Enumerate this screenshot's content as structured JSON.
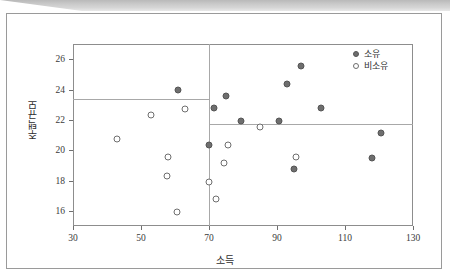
{
  "figure": {
    "background_color": "#ffffff",
    "frame_color": "#9a9a9a",
    "scan_strip_color": "#c9c9c9"
  },
  "chart_data": {
    "type": "scatter",
    "title": "",
    "xlabel": "소득",
    "ylabel": "주택규모",
    "xlim": [
      30,
      130
    ],
    "ylim": [
      15,
      27
    ],
    "xticks": [
      30,
      50,
      70,
      90,
      110,
      130
    ],
    "yticks": [
      16,
      18,
      20,
      22,
      24,
      26
    ],
    "grid": false,
    "legend_position": "top-right",
    "reference_lines": [
      {
        "name": "left-group-mean",
        "orientation": "horizontal",
        "value": 23.35,
        "x_from": 30,
        "x_to": 70,
        "color": "#a8a8a8"
      },
      {
        "name": "right-group-mean",
        "orientation": "horizontal",
        "value": 21.7,
        "x_from": 70,
        "x_to": 130,
        "color": "#a8a8a8"
      },
      {
        "name": "income-split",
        "orientation": "vertical",
        "value": 70,
        "color": "#a8a8a8"
      }
    ],
    "series": [
      {
        "name": "소유",
        "marker": "filled-circle",
        "color": "#6e6e6e",
        "points": [
          {
            "x": 61,
            "y": 23.95
          },
          {
            "x": 70,
            "y": 20.35
          },
          {
            "x": 71.5,
            "y": 22.75
          },
          {
            "x": 75,
            "y": 23.55
          },
          {
            "x": 79.5,
            "y": 21.9
          },
          {
            "x": 90.5,
            "y": 21.9
          },
          {
            "x": 93,
            "y": 24.35
          },
          {
            "x": 95,
            "y": 18.75
          },
          {
            "x": 97,
            "y": 25.55
          },
          {
            "x": 103,
            "y": 22.75
          },
          {
            "x": 118,
            "y": 19.5
          },
          {
            "x": 120.5,
            "y": 21.1
          }
        ]
      },
      {
        "name": "비소유",
        "marker": "open-circle",
        "color": "#6e6e6e",
        "points": [
          {
            "x": 43,
            "y": 20.75
          },
          {
            "x": 53,
            "y": 22.3
          },
          {
            "x": 57.5,
            "y": 18.3
          },
          {
            "x": 58,
            "y": 19.55
          },
          {
            "x": 60.5,
            "y": 15.9
          },
          {
            "x": 63,
            "y": 22.7
          },
          {
            "x": 70,
            "y": 17.9
          },
          {
            "x": 72,
            "y": 16.75
          },
          {
            "x": 74.5,
            "y": 19.15
          },
          {
            "x": 75.5,
            "y": 20.35
          },
          {
            "x": 85,
            "y": 21.55
          },
          {
            "x": 95.5,
            "y": 19.55
          }
        ]
      }
    ]
  }
}
